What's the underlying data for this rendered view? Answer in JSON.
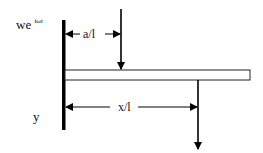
{
  "diagram": {
    "type": "cantilever-beam-schematic",
    "labels": {
      "base_excitation": "we",
      "base_excitation_exponent": "iωt",
      "load_position": "a/l",
      "measure_position": "x/l",
      "axis": "y"
    },
    "elements": {
      "wall": "fixed support (thick vertical line)",
      "beam": "horizontal rectangular beam",
      "applied_force": "downward arrow at a/l",
      "response_arrow": "downward arrow at x/l"
    },
    "colors": {
      "stroke": "#000000",
      "background": "#ffffff"
    }
  }
}
